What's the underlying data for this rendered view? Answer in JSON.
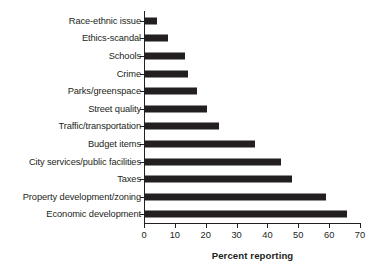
{
  "chart_data": {
    "type": "bar",
    "orientation": "horizontal",
    "title": "",
    "xlabel": "Percent reporting",
    "ylabel": "",
    "xlim": [
      0,
      70
    ],
    "xticks": [
      0,
      10,
      20,
      30,
      40,
      50,
      60,
      70
    ],
    "grid": false,
    "legend": null,
    "bar_color": "#231f20",
    "axis_color": "#231f20",
    "categories": [
      "Race-ethnic issue",
      "Ethics-scandal",
      "Schools",
      "Crime",
      "Parks/greenspace",
      "Street quality",
      "Traffic/transportation",
      "Budget items",
      "City services/public facilities",
      "Taxes",
      "Property development/zoning",
      "Economic development"
    ],
    "values": [
      4,
      7.5,
      13,
      14,
      17,
      20,
      24,
      35.5,
      44,
      47.5,
      58.5,
      65.5
    ]
  }
}
